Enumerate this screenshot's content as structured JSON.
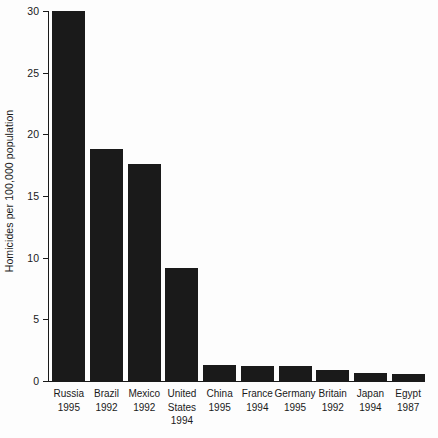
{
  "chart_data": {
    "type": "bar",
    "title": "",
    "subtitle": "",
    "xlabel": "",
    "ylabel": "Homicides per 100,000 population",
    "ylim": [
      0,
      30
    ],
    "yticks": [
      0,
      5,
      10,
      15,
      20,
      25,
      30
    ],
    "ytick_labels": [
      "0",
      "5",
      "10",
      "15",
      "20",
      "25",
      "30"
    ],
    "grid": false,
    "legend": null,
    "bar_color": "#1a1a1a",
    "background_color": "#fdfdfd",
    "axis_color": "#1a1a1a",
    "categories": [
      "Russia",
      "Brazil",
      "Mexico",
      "United States",
      "China",
      "France",
      "Germany",
      "Britain",
      "Japan",
      "Egypt"
    ],
    "category_label_lines": [
      [
        "Russia",
        "1995"
      ],
      [
        "Brazil",
        "1992"
      ],
      [
        "Mexico",
        "1992"
      ],
      [
        "United",
        "States",
        "1994"
      ],
      [
        "China",
        "1995"
      ],
      [
        "France",
        "1994"
      ],
      [
        "Germany",
        "1995"
      ],
      [
        "Britain",
        "1992"
      ],
      [
        "Japan",
        "1994"
      ],
      [
        "Egypt",
        "1987"
      ]
    ],
    "years": [
      1995,
      1992,
      1992,
      1994,
      1995,
      1994,
      1995,
      1992,
      1994,
      1987
    ],
    "values": [
      30.0,
      18.8,
      17.6,
      9.2,
      1.3,
      1.25,
      1.2,
      0.9,
      0.65,
      0.55
    ]
  },
  "axis": {
    "y_title": "Homicides per 100,000 population"
  }
}
